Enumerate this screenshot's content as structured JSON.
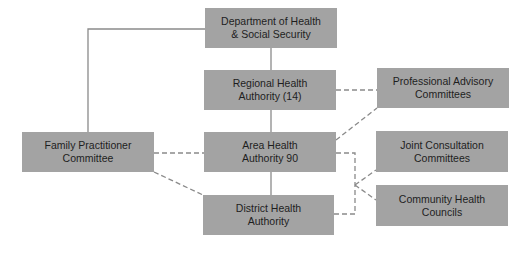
{
  "diagram": {
    "type": "organizational-chart",
    "colors": {
      "box_fill": "#a3a3a3",
      "text": "#1e1e1e",
      "line": "#8a8a8a",
      "background": "#ffffff"
    },
    "nodes": {
      "dhss": {
        "line1": "Department of Health",
        "line2": "& Social Security"
      },
      "rha": {
        "line1": "Regional Health",
        "line2": "Authority (14)"
      },
      "aha": {
        "line1": "Area Health",
        "line2": "Authority 90"
      },
      "dha": {
        "line1": "District Health",
        "line2": "Authority"
      },
      "fpc": {
        "line1": "Family Practitioner",
        "line2": "Committee"
      },
      "pac": {
        "line1": "Professional Advisory",
        "line2": "Committees"
      },
      "jcc": {
        "line1": "Joint Consultation",
        "line2": "Committees"
      },
      "chc": {
        "line1": "Community Health",
        "line2": "Councils"
      }
    },
    "edges": [
      {
        "from": "dhss",
        "to": "rha",
        "style": "solid"
      },
      {
        "from": "rha",
        "to": "aha",
        "style": "solid"
      },
      {
        "from": "aha",
        "to": "dha",
        "style": "solid"
      },
      {
        "from": "dhss",
        "to": "fpc",
        "style": "solid"
      },
      {
        "from": "rha",
        "to": "pac",
        "style": "dashed"
      },
      {
        "from": "aha",
        "to": "pac",
        "style": "dashed"
      },
      {
        "from": "fpc",
        "to": "aha",
        "style": "dashed"
      },
      {
        "from": "fpc",
        "to": "dha",
        "style": "dashed"
      },
      {
        "from": "aha",
        "to": "jcc",
        "style": "dashed"
      },
      {
        "from": "aha",
        "to": "chc",
        "style": "dashed"
      },
      {
        "from": "dha",
        "to": "jcc",
        "style": "dashed"
      },
      {
        "from": "dha",
        "to": "chc",
        "style": "dashed"
      }
    ]
  }
}
